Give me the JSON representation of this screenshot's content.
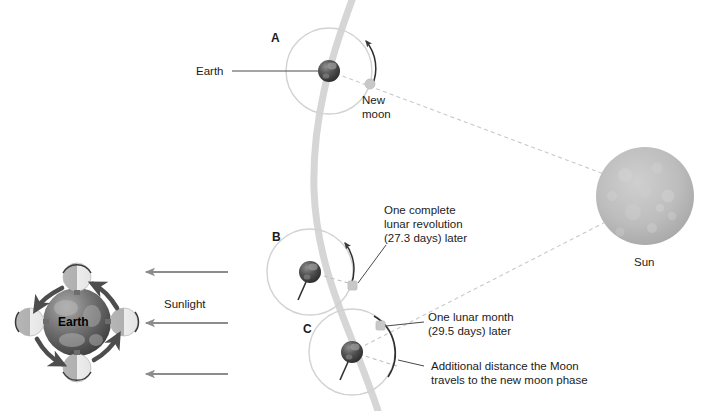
{
  "figure": {
    "background_color": "#ffffff"
  },
  "colors": {
    "orbit_path": "#cfcfcf",
    "earth_track": "#d4d4d4",
    "dashed_sightline": "#c9c9c9",
    "arrow_dark": "#3a3a3a",
    "arrow_grey": "#8c8c8c",
    "moon_marker": "#c2c2c2",
    "sun_body": "#b8b8b8",
    "text": "#1c1c1c",
    "leader_line": "#4a4a4a"
  },
  "main_diagram": {
    "positions": [
      {
        "key": "A",
        "label": "A",
        "caption": "New\nmoon"
      },
      {
        "key": "B",
        "label": "B",
        "caption": "One complete\nlunar revolution\n(27.3 days) later"
      },
      {
        "key": "C",
        "label": "C",
        "caption": "One lunar month\n(29.5 days) later"
      }
    ],
    "labels": {
      "position_a": "A",
      "position_b": "B",
      "position_c": "C",
      "earth": "Earth",
      "new_moon_line1": "New",
      "new_moon_line2": "moon",
      "revolution_line1": "One complete",
      "revolution_line2": "lunar revolution",
      "revolution_line3": "(27.3 days) later",
      "lunar_month_line1": "One lunar month",
      "lunar_month_line2": "(29.5 days) later",
      "additional_line1": "Additional distance the Moon",
      "additional_line2": "travels to the new moon phase",
      "sun": "Sun"
    }
  },
  "inset_diagram": {
    "labels": {
      "earth": "Earth",
      "sunlight": "Sunlight"
    },
    "sunlight_arrows": 3,
    "moon_phase_count": 4
  }
}
